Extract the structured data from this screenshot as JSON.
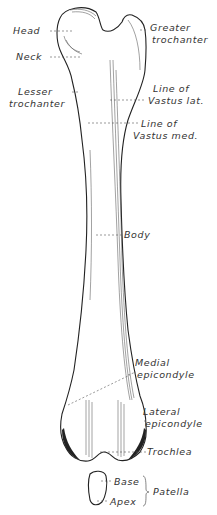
{
  "figure": {
    "labels": {
      "head": "Head",
      "neck": "Neck",
      "greater_trochanter_1": "Greater",
      "greater_trochanter_2": "trochanter",
      "lesser_trochanter_1": "Lesser",
      "lesser_trochanter_2": "trochanter",
      "line_vastus_lat_1": "Line of",
      "line_vastus_lat_2": "Vastus lat.",
      "line_vastus_med_1": "Line of",
      "line_vastus_med_2": "Vastus med.",
      "body": "Body",
      "medial_epicondyle_1": "Medial",
      "medial_epicondyle_2": "epicondyle",
      "lateral_epicondyle_1": "Lateral",
      "lateral_epicondyle_2": "epicondyle",
      "trochlea": "Trochlea",
      "base": "Base",
      "apex": "Apex",
      "patella": "Patella"
    }
  }
}
